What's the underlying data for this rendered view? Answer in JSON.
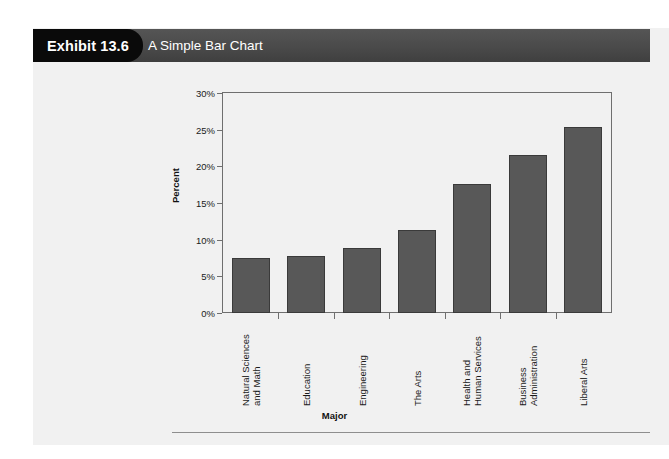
{
  "header": {
    "exhibit_tag": "Exhibit 13.6",
    "title": "A Simple Bar Chart",
    "tag_bg": "#0a0a0a",
    "banner_bg": "#4a4a4a",
    "text_color": "#ffffff"
  },
  "chart_data": {
    "type": "bar",
    "title": "A Simple Bar Chart",
    "categories": [
      "Natural Sciences and Math",
      "Education",
      "Engineering",
      "The Arts",
      "Health and Human Services",
      "Business Administration",
      "Liberal Arts"
    ],
    "category_lines": [
      [
        "Natural Sciences",
        "and Math"
      ],
      [
        "Education"
      ],
      [
        "Engineering"
      ],
      [
        "The Arts"
      ],
      [
        "Health and",
        "Human Services"
      ],
      [
        "Business",
        "Administration"
      ],
      [
        "Liberal Arts"
      ]
    ],
    "values": [
      7.5,
      7.8,
      8.8,
      11.3,
      17.6,
      21.6,
      25.3
    ],
    "value_labels": [
      "7.5%",
      "7.8%",
      "8.8%",
      "11.3%",
      "17.6%",
      "21.6%",
      "25.3%"
    ],
    "xlabel": "Major",
    "ylabel": "Percent",
    "ylim": [
      0,
      30
    ],
    "yticks": [
      0,
      5,
      10,
      15,
      20,
      25,
      30
    ],
    "ytick_labels": [
      "0%",
      "5%",
      "10%",
      "15%",
      "20%",
      "25%",
      "30%"
    ],
    "grid": false,
    "legend": null,
    "bar_color": "#585858",
    "bar_edge_color": "#3a3a3a",
    "plot_bg": "#f1f1f1",
    "axis_color": "#6f6f6f"
  }
}
